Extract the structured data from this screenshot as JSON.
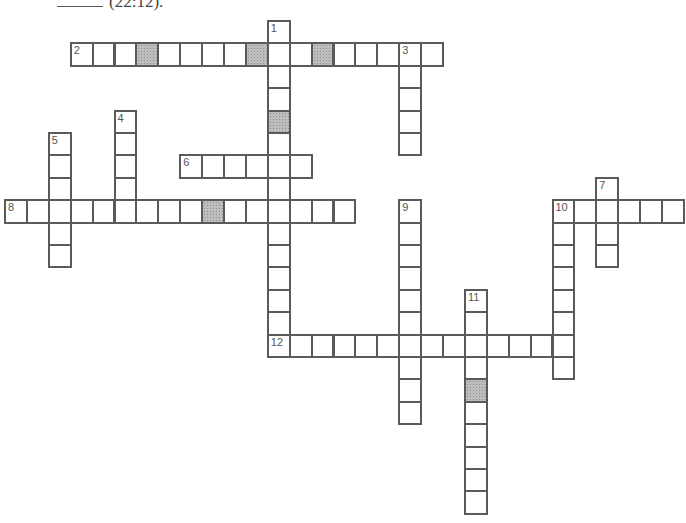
{
  "header": {
    "blank": "______",
    "text": "(22:12)."
  },
  "grid": {
    "origin_x": 4,
    "origin_y": 20,
    "cell_w": 21.9,
    "cell_h": 22.4,
    "line_color": "#5a5a5a",
    "shade_color": "#bdbdbd"
  },
  "entries": [
    {
      "number": 1,
      "direction": "down",
      "row": 0,
      "col": 12,
      "length": 15,
      "shaded": [
        4
      ]
    },
    {
      "number": 2,
      "direction": "across",
      "row": 1,
      "col": 3,
      "length": 17,
      "shaded": [
        3,
        8,
        11
      ]
    },
    {
      "number": 3,
      "direction": "down",
      "row": 1,
      "col": 18,
      "length": 5,
      "shaded": []
    },
    {
      "number": 4,
      "direction": "down",
      "row": 4,
      "col": 5,
      "length": 5,
      "shaded": []
    },
    {
      "number": 5,
      "direction": "down",
      "row": 5,
      "col": 2,
      "length": 6,
      "shaded": []
    },
    {
      "number": 6,
      "direction": "across",
      "row": 6,
      "col": 8,
      "length": 6,
      "shaded": []
    },
    {
      "number": 7,
      "direction": "down",
      "row": 7,
      "col": 27,
      "length": 4,
      "shaded": []
    },
    {
      "number": 8,
      "direction": "across",
      "row": 8,
      "col": 0,
      "length": 16,
      "shaded": [
        9
      ]
    },
    {
      "number": 9,
      "direction": "down",
      "row": 8,
      "col": 18,
      "length": 10,
      "shaded": []
    },
    {
      "number": 10,
      "direction": "across",
      "row": 8,
      "col": 25,
      "length": 6,
      "shaded": []
    },
    {
      "number": 10,
      "direction": "down",
      "row": 8,
      "col": 25,
      "length": 8,
      "shaded": []
    },
    {
      "number": 11,
      "direction": "down",
      "row": 12,
      "col": 21,
      "length": 10,
      "shaded": [
        4
      ]
    },
    {
      "number": 12,
      "direction": "across",
      "row": 14,
      "col": 12,
      "length": 14,
      "shaded": []
    }
  ]
}
